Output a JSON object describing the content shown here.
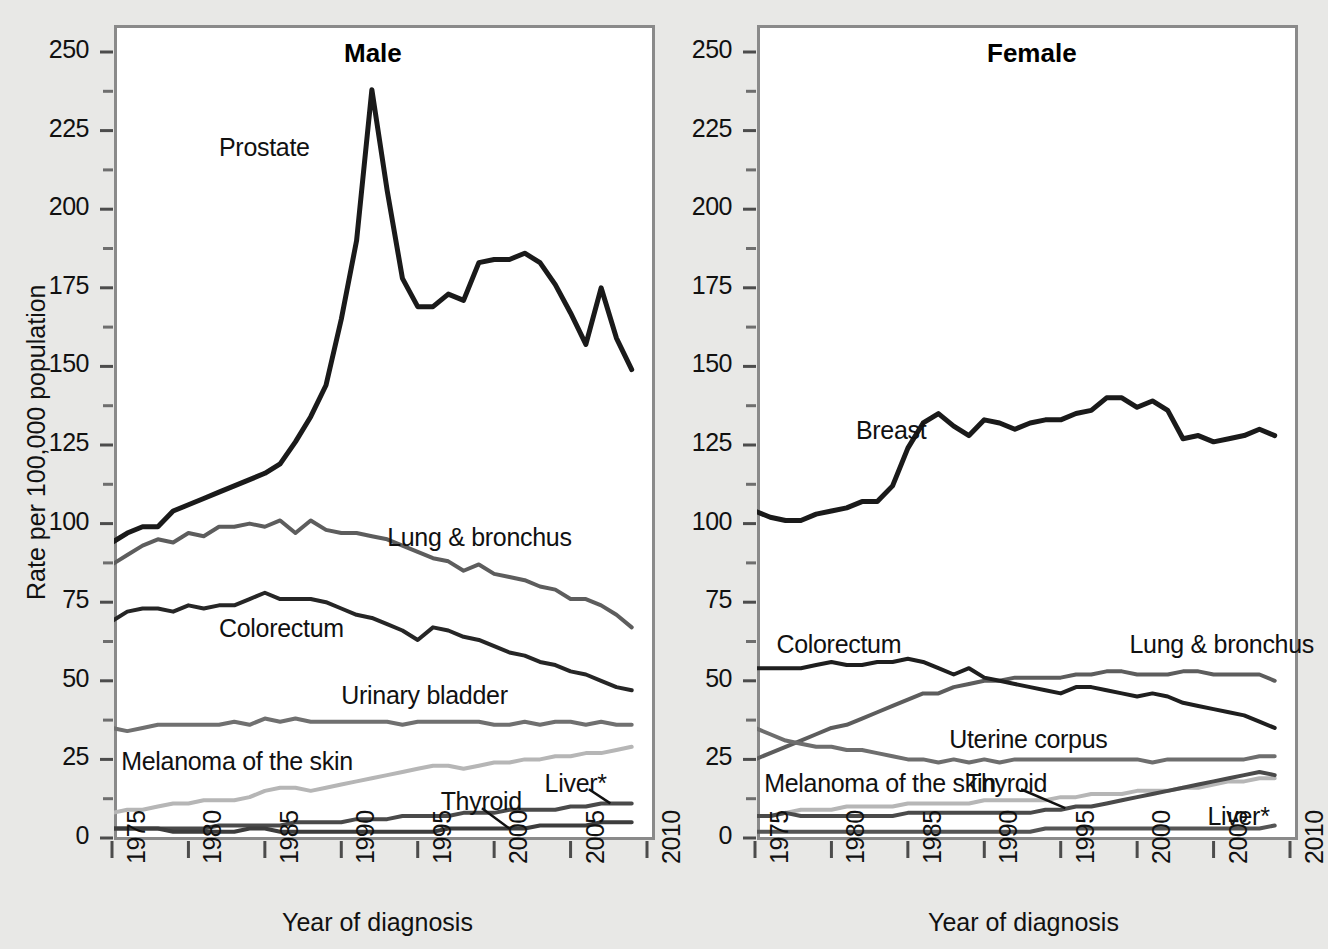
{
  "figure": {
    "background_color": "#e8e8e6",
    "panel_background": "#ffffff",
    "frame_color": "#8a8a8a",
    "axis_title_y": "Rate per 100,000 population",
    "axis_title_x_male": "Year of diagnosis",
    "axis_title_x_female": "Year of diagnosis",
    "y_ticks": [
      "250",
      "225",
      "200",
      "175",
      "150",
      "125",
      "100",
      "75",
      "50",
      "25",
      "0"
    ],
    "x_ticks": [
      "1975",
      "1980",
      "1985",
      "1990",
      "1995",
      "2000",
      "2005",
      "2010"
    ]
  },
  "chart_data": [
    {
      "type": "line",
      "title": "Male",
      "xlabel": "Year of diagnosis",
      "ylabel": "Rate per 100,000 population",
      "xlim": [
        1975,
        2010
      ],
      "ylim": [
        0,
        260
      ],
      "ytick_values": [
        0,
        25,
        50,
        75,
        100,
        125,
        150,
        175,
        200,
        225,
        250
      ],
      "minor_tick_step": 12.5,
      "xtick_values": [
        1975,
        1980,
        1985,
        1990,
        1995,
        2000,
        2005,
        2010
      ],
      "grid": false,
      "legend": "inline-labels",
      "x": [
        1975,
        1976,
        1977,
        1978,
        1979,
        1980,
        1981,
        1982,
        1983,
        1984,
        1985,
        1986,
        1987,
        1988,
        1989,
        1990,
        1991,
        1992,
        1993,
        1994,
        1995,
        1996,
        1997,
        1998,
        1999,
        2000,
        2001,
        2002,
        2003,
        2004,
        2005,
        2006,
        2007,
        2008,
        2009
      ],
      "series": [
        {
          "name": "Prostate",
          "color": "#1a1a1a",
          "width": 5,
          "label_x": 1982.0,
          "label_y": 219,
          "values": [
            94,
            97,
            99,
            99,
            104,
            106,
            108,
            110,
            112,
            114,
            116,
            119,
            126,
            134,
            144,
            165,
            190,
            238,
            206,
            178,
            169,
            169,
            173,
            171,
            183,
            184,
            184,
            186,
            183,
            176,
            167,
            157,
            175,
            159,
            149
          ]
        },
        {
          "name": "Lung & bronchus",
          "color": "#5d5d5d",
          "width": 4,
          "label_x": 1993.0,
          "label_y": 95,
          "values": [
            87,
            90,
            93,
            95,
            94,
            97,
            96,
            99,
            99,
            100,
            99,
            101,
            97,
            101,
            98,
            97,
            97,
            96,
            95,
            93,
            91,
            89,
            88,
            85,
            87,
            84,
            83,
            82,
            80,
            79,
            76,
            76,
            74,
            71,
            67
          ]
        },
        {
          "name": "Colorectum",
          "color": "#262626",
          "width": 4,
          "label_x": 1982.0,
          "label_y": 66,
          "values": [
            69,
            72,
            73,
            73,
            72,
            74,
            73,
            74,
            74,
            76,
            78,
            76,
            76,
            76,
            75,
            73,
            71,
            70,
            68,
            66,
            63,
            67,
            66,
            64,
            63,
            61,
            59,
            58,
            56,
            55,
            53,
            52,
            50,
            48,
            47
          ]
        },
        {
          "name": "Urinary bladder",
          "color": "#707070",
          "width": 4,
          "label_x": 1990.0,
          "label_y": 45,
          "values": [
            35,
            34,
            35,
            36,
            36,
            36,
            36,
            36,
            37,
            36,
            38,
            37,
            38,
            37,
            37,
            37,
            37,
            37,
            37,
            36,
            37,
            37,
            37,
            37,
            37,
            36,
            36,
            37,
            36,
            37,
            37,
            36,
            37,
            36,
            36
          ]
        },
        {
          "name": "Melanoma of the skin",
          "color": "#b6b6b6",
          "width": 4,
          "label_x": 1975.6,
          "label_y": 24,
          "values": [
            8,
            9,
            9,
            10,
            11,
            11,
            12,
            12,
            12,
            13,
            15,
            16,
            16,
            15,
            16,
            17,
            18,
            19,
            20,
            21,
            22,
            23,
            23,
            22,
            23,
            24,
            24,
            25,
            25,
            26,
            26,
            27,
            27,
            28,
            29
          ]
        },
        {
          "name": "Liver*",
          "color": "#4a4a4a",
          "width": 4,
          "label_x": 2003.3,
          "label_y": 17,
          "values": [
            3,
            3,
            3,
            3,
            3,
            3,
            3,
            4,
            4,
            4,
            4,
            4,
            5,
            5,
            5,
            5,
            6,
            6,
            6,
            7,
            7,
            7,
            7,
            8,
            8,
            8,
            9,
            9,
            9,
            9,
            10,
            10,
            11,
            11,
            11
          ]
        },
        {
          "name": "Thyroid",
          "color": "#3d3d3d",
          "width": 4,
          "label_x": 1996.5,
          "label_y": 11,
          "values": [
            3,
            3,
            3,
            3,
            2,
            2,
            2,
            2,
            2,
            3,
            3,
            2,
            2,
            2,
            2,
            2,
            2,
            2,
            2,
            2,
            2,
            2,
            3,
            3,
            3,
            3,
            3,
            3,
            4,
            4,
            4,
            4,
            5,
            5,
            5
          ]
        }
      ],
      "annotations": [
        {
          "text": "Thyroid",
          "leader_from": [
            1999.2,
            9.5
          ],
          "leader_to": [
            2001.0,
            3.0
          ]
        },
        {
          "text": "Liver*",
          "leader_from": [
            2006.2,
            15.5
          ],
          "leader_to": [
            2007.6,
            11.0
          ]
        }
      ]
    },
    {
      "type": "line",
      "title": "Female",
      "xlabel": "Year of diagnosis",
      "ylabel": "Rate per 100,000 population",
      "xlim": [
        1975,
        2010
      ],
      "ylim": [
        0,
        260
      ],
      "ytick_values": [
        0,
        25,
        50,
        75,
        100,
        125,
        150,
        175,
        200,
        225,
        250
      ],
      "minor_tick_step": 12.5,
      "xtick_values": [
        1975,
        1980,
        1985,
        1990,
        1995,
        2000,
        2005,
        2010
      ],
      "grid": false,
      "legend": "inline-labels",
      "x": [
        1975,
        1976,
        1977,
        1978,
        1979,
        1980,
        1981,
        1982,
        1983,
        1984,
        1985,
        1986,
        1987,
        1988,
        1989,
        1990,
        1991,
        1992,
        1993,
        1994,
        1995,
        1996,
        1997,
        1998,
        1999,
        2000,
        2001,
        2002,
        2003,
        2004,
        2005,
        2006,
        2007,
        2008,
        2009
      ],
      "series": [
        {
          "name": "Breast",
          "color": "#1a1a1a",
          "width": 5,
          "label_x": 1981.6,
          "label_y": 129,
          "values": [
            104,
            102,
            101,
            101,
            103,
            104,
            105,
            107,
            107,
            112,
            124,
            132,
            135,
            131,
            128,
            133,
            132,
            130,
            132,
            133,
            133,
            135,
            136,
            140,
            140,
            137,
            139,
            136,
            127,
            128,
            126,
            127,
            128,
            130,
            128
          ]
        },
        {
          "name": "Lung & bronchus",
          "color": "#5d5d5d",
          "width": 4,
          "label_x": 1999.5,
          "label_y": 61,
          "values": [
            25,
            27,
            29,
            31,
            33,
            35,
            36,
            38,
            40,
            42,
            44,
            46,
            46,
            48,
            49,
            50,
            50,
            51,
            51,
            51,
            51,
            52,
            52,
            53,
            53,
            52,
            52,
            52,
            53,
            53,
            52,
            52,
            52,
            52,
            50
          ]
        },
        {
          "name": "Colorectum",
          "color": "#1f1f1f",
          "width": 4,
          "label_x": 1976.4,
          "label_y": 61,
          "values": [
            54,
            54,
            54,
            54,
            55,
            56,
            55,
            55,
            56,
            56,
            57,
            56,
            54,
            52,
            54,
            51,
            50,
            49,
            48,
            47,
            46,
            48,
            48,
            47,
            46,
            45,
            46,
            45,
            43,
            42,
            41,
            40,
            39,
            37,
            35
          ]
        },
        {
          "name": "Uterine corpus",
          "color": "#6e6e6e",
          "width": 4,
          "label_x": 1987.7,
          "label_y": 31,
          "values": [
            35,
            33,
            31,
            30,
            29,
            29,
            28,
            28,
            27,
            26,
            25,
            25,
            24,
            25,
            24,
            25,
            24,
            25,
            25,
            25,
            25,
            25,
            25,
            25,
            25,
            25,
            24,
            25,
            25,
            25,
            25,
            25,
            25,
            26,
            26
          ]
        },
        {
          "name": "Melanoma of the skin",
          "color": "#b6b6b6",
          "width": 4,
          "label_x": 1975.6,
          "label_y": 17,
          "values": [
            7,
            7,
            8,
            9,
            9,
            9,
            10,
            10,
            10,
            10,
            11,
            11,
            11,
            11,
            11,
            12,
            12,
            12,
            12,
            12,
            13,
            13,
            14,
            14,
            14,
            15,
            15,
            15,
            16,
            16,
            17,
            18,
            18,
            19,
            19
          ]
        },
        {
          "name": "Thyroid",
          "color": "#4a4a4a",
          "width": 4,
          "label_x": 1988.8,
          "label_y": 17,
          "values": [
            7,
            7,
            8,
            7,
            7,
            7,
            7,
            7,
            7,
            7,
            8,
            8,
            8,
            8,
            8,
            8,
            8,
            8,
            8,
            9,
            9,
            10,
            10,
            11,
            12,
            13,
            14,
            15,
            16,
            17,
            18,
            19,
            20,
            21,
            20
          ]
        },
        {
          "name": "Liver*",
          "color": "#555555",
          "width": 4,
          "label_x": 2004.6,
          "label_y": 6.5,
          "values": [
            2,
            2,
            2,
            2,
            2,
            2,
            2,
            2,
            2,
            2,
            2,
            2,
            2,
            2,
            2,
            2,
            2,
            2,
            2,
            3,
            3,
            3,
            3,
            3,
            3,
            3,
            3,
            3,
            3,
            3,
            3,
            3,
            3,
            3,
            4
          ]
        }
      ],
      "annotations": [
        {
          "text": "Thyroid",
          "leader_from": [
            1992.4,
            15.5
          ],
          "leader_to": [
            1995.3,
            9.5
          ]
        }
      ]
    }
  ]
}
